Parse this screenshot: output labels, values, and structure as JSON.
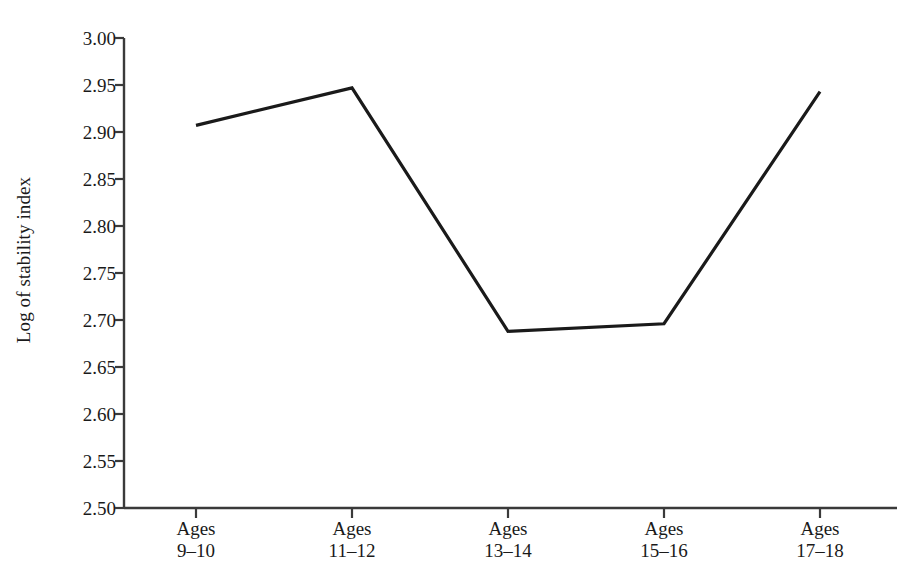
{
  "chart_data": {
    "type": "line",
    "title": "",
    "subtitle": "",
    "xlabel": "",
    "ylabel": "Log of stability index",
    "categories": [
      "Ages 9–10",
      "Ages 11–12",
      "Ages 13–14",
      "Ages 15–16",
      "Ages 17–18"
    ],
    "category_lines": [
      {
        "line1": "Ages",
        "line2": "9–10"
      },
      {
        "line1": "Ages",
        "line2": "11–12"
      },
      {
        "line1": "Ages",
        "line2": "13–14"
      },
      {
        "line1": "Ages",
        "line2": "15–16"
      },
      {
        "line1": "Ages",
        "line2": "17–18"
      }
    ],
    "values": [
      2.907,
      2.947,
      2.688,
      2.696,
      2.943
    ],
    "series": [
      {
        "name": "Log of stability index",
        "values": [
          2.907,
          2.947,
          2.688,
          2.696,
          2.943
        ],
        "color": "#1a1a1a"
      }
    ],
    "ylim": [
      2.5,
      3.0
    ],
    "ytick_values": [
      3.0,
      2.95,
      2.9,
      2.85,
      2.8,
      2.75,
      2.7,
      2.65,
      2.6,
      2.55,
      2.5
    ],
    "ytick_labels": [
      "3.00",
      "2.95",
      "2.90",
      "2.85",
      "2.80",
      "2.75",
      "2.70",
      "2.65",
      "2.60",
      "2.55",
      "2.50"
    ],
    "grid": false,
    "legend": "none",
    "markers": false,
    "line_color": "#1a1a1a",
    "line_width": 3,
    "axis_color": "#3a3a3a",
    "background_color": "#ffffff"
  },
  "yticks": {
    "t0": "3.00",
    "t1": "2.95",
    "t2": "2.90",
    "t3": "2.85",
    "t4": "2.80",
    "t5": "2.75",
    "t6": "2.70",
    "t7": "2.65",
    "t8": "2.60",
    "t9": "2.55",
    "t10": "2.50"
  },
  "xticks": {
    "c0_l1": "Ages",
    "c0_l2": "9–10",
    "c1_l1": "Ages",
    "c1_l2": "11–12",
    "c2_l1": "Ages",
    "c2_l2": "13–14",
    "c3_l1": "Ages",
    "c3_l2": "15–16",
    "c4_l1": "Ages",
    "c4_l2": "17–18"
  },
  "axis": {
    "y_title": "Log of stability index"
  }
}
